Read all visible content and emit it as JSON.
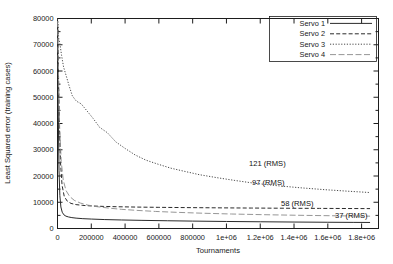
{
  "chart_data": {
    "type": "line",
    "title": "",
    "xlabel": "Tournaments",
    "ylabel": "Least Squared error (training cases)",
    "xlim": [
      0,
      1900000
    ],
    "ylim": [
      0,
      80000
    ],
    "grid": false,
    "legend_position": "top-right",
    "xticks": [
      0,
      200000,
      400000,
      600000,
      800000,
      1000000,
      1200000,
      1400000,
      1600000,
      1800000
    ],
    "xtick_labels": [
      "0",
      "200000",
      "400000",
      "600000",
      "800000",
      "1e+06",
      "1.2e+06",
      "1.4e+06",
      "1.6e+06",
      "1.8e+06"
    ],
    "yticks": [
      0,
      10000,
      20000,
      30000,
      40000,
      50000,
      60000,
      70000,
      80000
    ],
    "ytick_labels": [
      "0",
      "10000",
      "20000",
      "30000",
      "40000",
      "50000",
      "60000",
      "70000",
      "80000"
    ],
    "series": [
      {
        "name": "Servo 1",
        "style": "solid",
        "color": "#2b2b2b",
        "final_annotation": "37 (RMS)",
        "x": [
          0,
          4000,
          9000,
          14000,
          20000,
          28000,
          38000,
          50000,
          65000,
          85000,
          110000,
          150000,
          200000,
          280000,
          380000,
          500000,
          650000,
          800000,
          1000000,
          1200000,
          1400000,
          1600000,
          1750000,
          1850000
        ],
        "y": [
          79500,
          46000,
          22000,
          12500,
          8200,
          6200,
          5200,
          4700,
          4400,
          4150,
          3950,
          3750,
          3600,
          3400,
          3250,
          3100,
          2950,
          2820,
          2680,
          2560,
          2460,
          2380,
          2330,
          2300
        ]
      },
      {
        "name": "Servo 2",
        "style": "dashed",
        "color": "#2b2b2b",
        "final_annotation": "97 (RMS)",
        "x": [
          0,
          5000,
          11000,
          18000,
          27000,
          40000,
          58000,
          80000,
          110000,
          150000,
          200000,
          270000,
          360000,
          470000,
          600000,
          760000,
          950000,
          1150000,
          1350000,
          1550000,
          1720000,
          1850000
        ],
        "y": [
          79800,
          62000,
          40000,
          25000,
          16500,
          12200,
          10400,
          9550,
          9100,
          8800,
          8600,
          8420,
          8280,
          8160,
          8060,
          7960,
          7870,
          7790,
          7720,
          7660,
          7610,
          7580
        ]
      },
      {
        "name": "Servo 3",
        "style": "dotted",
        "color": "#4a4a4a",
        "final_annotation": "121 (RMS)",
        "x": [
          0,
          3000,
          7000,
          14000,
          24000,
          36000,
          50000,
          68000,
          88000,
          112000,
          140000,
          172000,
          210000,
          250000,
          295000,
          345000,
          400000,
          460000,
          525000,
          595000,
          670000,
          750000,
          840000,
          940000,
          1050000,
          1170000,
          1300000,
          1440000,
          1580000,
          1720000,
          1850000
        ],
        "y": [
          80000,
          78500,
          72500,
          70500,
          66000,
          61500,
          58500,
          54500,
          50500,
          48500,
          47500,
          45000,
          42000,
          38500,
          36500,
          33000,
          30500,
          28000,
          26000,
          24500,
          23000,
          21800,
          20500,
          19400,
          18300,
          17200,
          16300,
          15500,
          14800,
          14200,
          13700
        ]
      },
      {
        "name": "Servo 4",
        "style": "longdash",
        "color": "#8a8a8a",
        "final_annotation": "58 (RMS)",
        "x": [
          0,
          6000,
          13000,
          22000,
          34000,
          50000,
          72000,
          100000,
          135000,
          180000,
          235000,
          300000,
          380000,
          470000,
          580000,
          710000,
          860000,
          1030000,
          1220000,
          1420000,
          1620000,
          1850000
        ],
        "y": [
          79000,
          58000,
          38000,
          25500,
          18500,
          14500,
          12200,
          10700,
          9700,
          8900,
          8300,
          7800,
          7300,
          6900,
          6500,
          6150,
          5820,
          5520,
          5260,
          5040,
          4860,
          4700
        ]
      }
    ],
    "annotations": [
      {
        "text": "121 (RMS)",
        "series": "Servo 3"
      },
      {
        "text": "97 (RMS)",
        "series": "Servo 2"
      },
      {
        "text": "58 (RMS)",
        "series": "Servo 4"
      },
      {
        "text": "37 (RMS)",
        "series": "Servo 1"
      }
    ],
    "legend_entries": [
      {
        "label": "Servo 1",
        "style": "solid"
      },
      {
        "label": "Servo 2",
        "style": "dashed"
      },
      {
        "label": "Servo 3",
        "style": "dotted"
      },
      {
        "label": "Servo 4",
        "style": "longdash"
      }
    ]
  }
}
